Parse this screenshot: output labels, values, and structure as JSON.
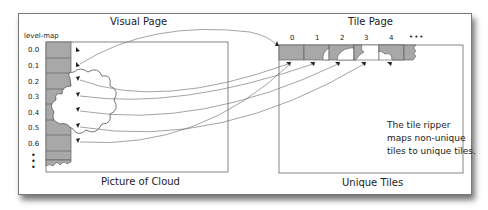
{
  "visual_page": {
    "title": "Visual Page",
    "caption": "Picture of Cloud",
    "level_map_label": "level-map",
    "rows": [
      "0.0",
      "0.1",
      "0.2",
      "0.3",
      "0.4",
      "0.5",
      "0.6"
    ]
  },
  "tile_page": {
    "title": "Tile Page",
    "caption": "Unique Tiles",
    "indices": [
      "0",
      "1",
      "2",
      "3",
      "4"
    ],
    "ellipsis": "•••"
  },
  "note": {
    "line1": "The tile ripper",
    "line2": "maps non-unique",
    "line3": "tiles to unique tiles."
  },
  "colors": {
    "tile_fill": "#a8a8a8",
    "line": "#555555"
  }
}
